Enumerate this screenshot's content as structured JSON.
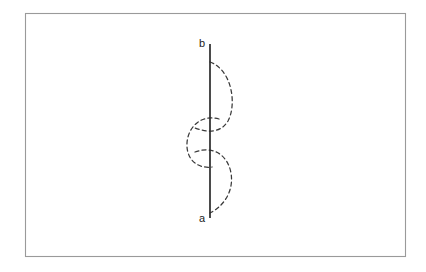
{
  "figure": {
    "title": "",
    "background_color": "#ffffff",
    "frame": {
      "name": "figure-border",
      "x": 25,
      "y": 13,
      "width": 380,
      "height": 243,
      "stroke_color": "#9a9a9a"
    },
    "axis": {
      "name": "vertical-segment",
      "x": 210,
      "y_top": 44,
      "y_bottom": 218,
      "stroke_color": "#2b2b2b"
    },
    "labels": {
      "top": "b",
      "bottom": "a",
      "top_x": 202,
      "top_y": 46,
      "bottom_x": 202,
      "bottom_y": 222,
      "color": "#1c1c1c"
    },
    "arcs": [
      {
        "name": "upper-arc",
        "bulge_direction": "right",
        "start_y": 62,
        "end_y": 131,
        "extent_x": 234,
        "path": "M 210 62 C 232 70 236 104 228 120 C 222 130 212 133 196 128"
      },
      {
        "name": "middle-arc",
        "bulge_direction": "left",
        "start_y": 119,
        "end_y": 168,
        "extent_x": 186,
        "path": "M 218 119 C 200 115 188 128 187 143 C 186 158 196 168 211 167"
      },
      {
        "name": "lower-arc",
        "bulge_direction": "right",
        "start_y": 150,
        "end_y": 213,
        "extent_x": 233,
        "path": "M 196 152 C 214 145 228 156 231 172 C 234 190 224 206 210 213"
      }
    ],
    "stroke_color_dashed": "#3a3a3a",
    "dash_pattern": "4 3.2"
  }
}
